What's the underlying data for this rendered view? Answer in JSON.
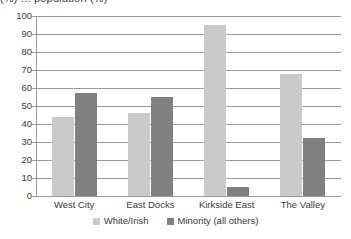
{
  "chart_data": {
    "type": "bar",
    "title": "(%) ... population (%)",
    "title_cropped": true,
    "categories": [
      "West City",
      "East Docks",
      "Kirkside East",
      "The Valley"
    ],
    "series": [
      {
        "name": "White/Irish",
        "color": "#c9c9c9",
        "values": [
          44,
          46,
          95,
          68
        ]
      },
      {
        "name": "Minority (all others)",
        "color": "#808080",
        "values": [
          57,
          55,
          5,
          32
        ]
      }
    ],
    "xlabel": "",
    "ylabel": "",
    "ylim": [
      0,
      100
    ],
    "ytick_step": 10,
    "yticks": [
      "0",
      "10",
      "20",
      "30",
      "40",
      "50",
      "60",
      "70",
      "80",
      "90",
      "100"
    ],
    "grid": true,
    "legend_position": "bottom"
  },
  "axis": {
    "line_color": "#9a9a9a"
  }
}
